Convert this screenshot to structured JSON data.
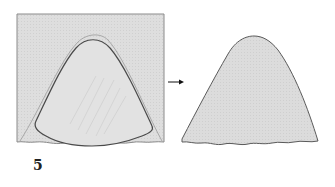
{
  "figure": {
    "label": "5",
    "colors": {
      "panel_fill": "#dedede",
      "panel_border": "#8a8a8a",
      "outline_dark": "#4a4a4a",
      "outline_faint": "#a8a8a8",
      "shape_fill": "#dcdcdc",
      "arrow": "#111111"
    },
    "panels": [
      {
        "name": "before",
        "description": "Rectangular block with inner rounded cone outline"
      },
      {
        "name": "after",
        "description": "Resulting rounded cone shape"
      }
    ]
  }
}
